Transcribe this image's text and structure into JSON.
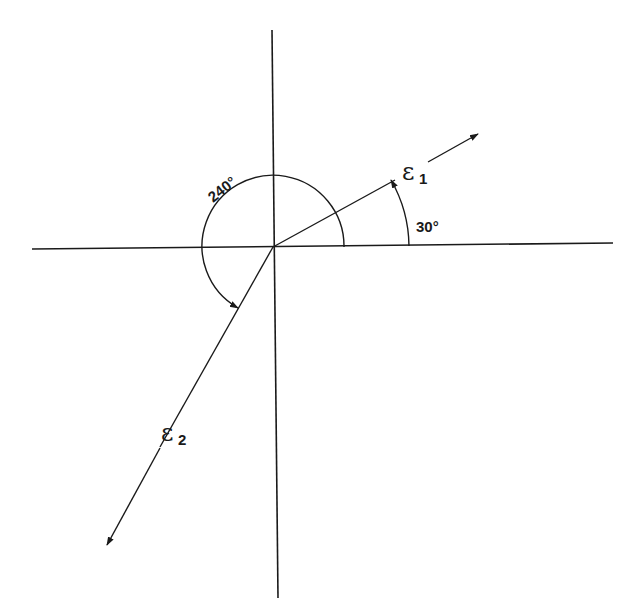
{
  "diagram": {
    "type": "strain-direction-diagram",
    "colors": {
      "stroke": "#1a1a1a",
      "background": "#ffffff"
    },
    "axes": {
      "horizontal": {
        "x1": 32,
        "y1": 249,
        "x2": 613,
        "y2": 243
      },
      "vertical": {
        "x1": 272,
        "y1": 30,
        "x2": 278,
        "y2": 598
      },
      "origin": {
        "x": 273,
        "y": 247
      }
    },
    "vectors": [
      {
        "id": "e1",
        "symbol": "ε",
        "subscript": "1",
        "angle_deg": 30
      },
      {
        "id": "e2",
        "symbol": "ε",
        "subscript": "2",
        "angle_deg": 240
      }
    ],
    "angle_labels": {
      "a30": "30°",
      "a240": "240°"
    }
  }
}
